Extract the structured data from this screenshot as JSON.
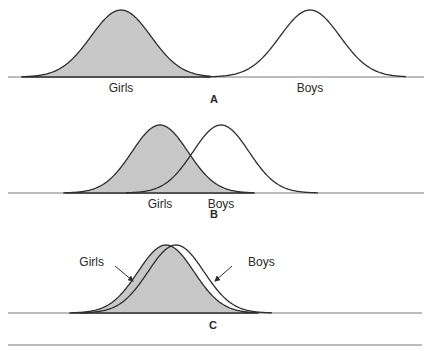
{
  "colors": {
    "girls_fill": "#c8c8c8",
    "stroke": "#2e2e2e",
    "baseline": "#7a7a7a",
    "background": "#ffffff"
  },
  "panels": [
    {
      "id": "A",
      "letter": "A",
      "baseline_y": 77,
      "baseline_x": [
        8,
        424
      ],
      "letter_pos": [
        214,
        103
      ],
      "girls": {
        "label": "Girls",
        "mu": 121,
        "sigma": 30,
        "peak_y": 10,
        "extent": [
          22,
          210
        ],
        "label_pos": [
          121,
          92
        ]
      },
      "boys": {
        "label": "Boys",
        "mu": 310,
        "sigma": 30,
        "peak_y": 10,
        "extent": [
          206,
          406
        ],
        "label_pos": [
          310,
          92
        ]
      },
      "label_style": "under"
    },
    {
      "id": "B",
      "letter": "B",
      "baseline_y": 193,
      "baseline_x": [
        8,
        424
      ],
      "letter_pos": [
        214,
        218
      ],
      "girls": {
        "label": "Girls",
        "mu": 160,
        "sigma": 28,
        "peak_y": 125,
        "extent": [
          64,
          254
        ],
        "label_pos": [
          160,
          208
        ]
      },
      "boys": {
        "label": "Boys",
        "mu": 221,
        "sigma": 28,
        "peak_y": 125,
        "extent": [
          126,
          318
        ],
        "label_pos": [
          221,
          208
        ]
      },
      "label_style": "under"
    },
    {
      "id": "C",
      "letter": "C",
      "baseline_y": 313,
      "baseline_x": [
        8,
        422
      ],
      "letter_pos": [
        213,
        329
      ],
      "girls": {
        "label": "Girls",
        "mu": 166,
        "sigma": 28,
        "peak_y": 245,
        "extent": [
          70,
          258
        ],
        "label_pos": [
          104,
          266
        ],
        "arrow": [
          [
            115,
            266
          ],
          [
            133,
            281
          ]
        ]
      },
      "boys": {
        "label": "Boys",
        "mu": 176,
        "sigma": 28,
        "peak_y": 245,
        "extent": [
          80,
          272
        ],
        "label_pos": [
          248,
          266
        ],
        "arrow": [
          [
            232,
            266
          ],
          [
            215,
            281
          ]
        ]
      },
      "label_style": "arrow"
    }
  ],
  "bottom_rule": {
    "y": 345,
    "x": [
      8,
      422
    ]
  }
}
